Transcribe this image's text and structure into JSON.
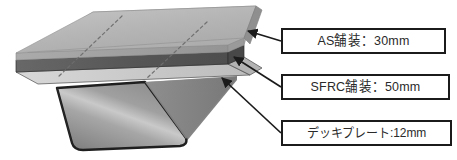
{
  "figure": {
    "kind": "isometric-cross-section"
  },
  "callouts": [
    {
      "id": "as",
      "label": "AS舗装：30mm",
      "material": "AS舗装",
      "thickness_mm": 30,
      "target": "top-asphalt-surface-layer"
    },
    {
      "id": "sfrc",
      "label": "SFRC舗装：50mm",
      "material": "SFRC舗装",
      "thickness_mm": 50,
      "target": "middle-sfrc-layer"
    },
    {
      "id": "deck",
      "label": "デッキプレート:12mm",
      "material": "デッキプレート",
      "thickness_mm": 12,
      "target": "steel-deck-plate"
    }
  ],
  "colors": {
    "outline": "#1b1b1b",
    "as_top_face": "#b9b9b9",
    "as_edge_face": "#a2a2a2",
    "sfrc_face": "#5e5e5e",
    "deck_face": "#cfcfcf",
    "rib_face": "#9b9b9b",
    "rib_side_face": "#878787",
    "label_text": "#2a2a2a",
    "background": "#ffffff"
  },
  "annotations": {
    "weld_seam_lines": 2,
    "weld_line_style": "dashed-diagonal"
  }
}
